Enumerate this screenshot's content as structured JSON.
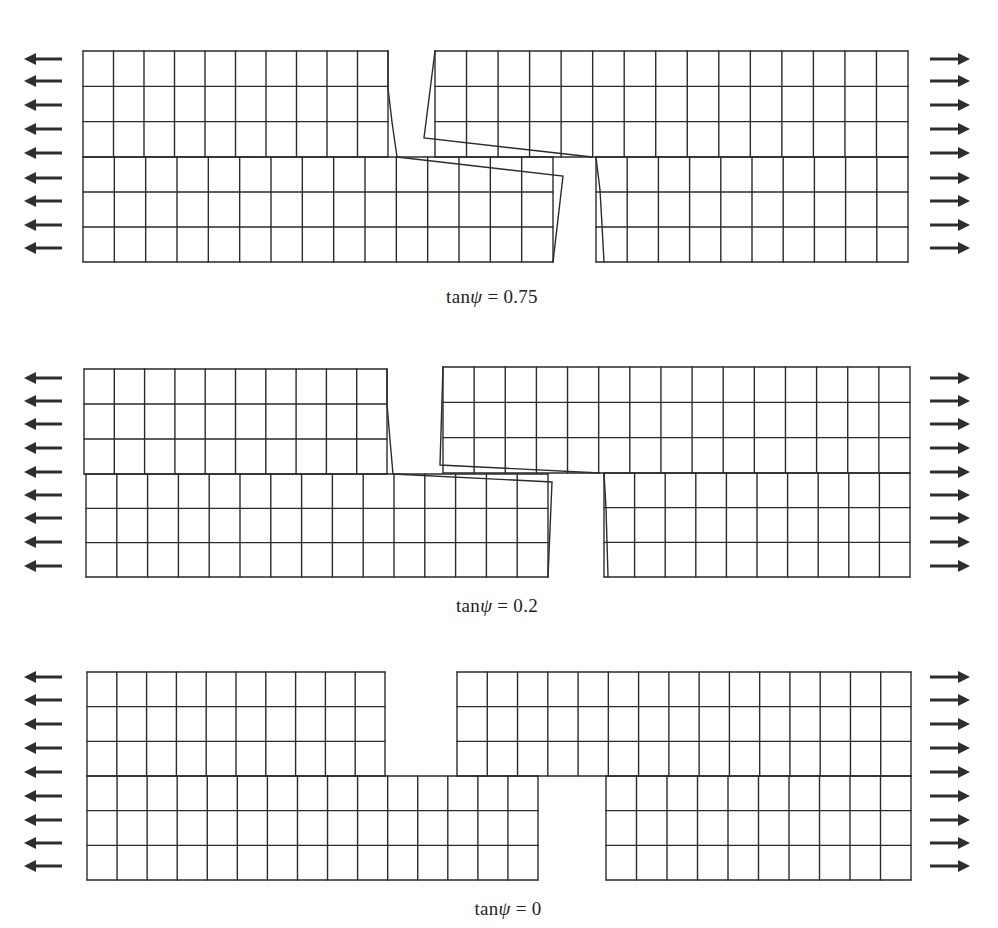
{
  "figure": {
    "background": "#ffffff",
    "line_color": "#2b2b2b",
    "panels": [
      {
        "id": "panel-1",
        "caption": {
          "prefix": "tan",
          "symbol": "ψ",
          "suffix": " = 0.75",
          "x": 492,
          "y": 288
        },
        "rows": {
          "top": 51,
          "mid": 157,
          "bottom": 262,
          "n_upper": 3,
          "n_lower": 3
        },
        "blocks": [
          {
            "name": "upper-left-block",
            "x0": 83,
            "x1": 388,
            "y0": 51,
            "y1": 157,
            "cols": 10,
            "skew_right": [
              [
                388,
                51
              ],
              [
                388,
                88
              ],
              [
                392,
                122
              ],
              [
                397,
                157
              ]
            ]
          },
          {
            "name": "lower-left-block",
            "x0": 83,
            "x1": 553,
            "y0": 157,
            "y1": 262,
            "cols": 15,
            "tip": [
              [
                397,
                157
              ],
              [
                563,
                176
              ],
              [
                553,
                262
              ]
            ]
          },
          {
            "name": "upper-right-block",
            "x0": 435,
            "x1": 908,
            "y0": 51,
            "y1": 157,
            "cols": 15,
            "tip": [
              [
                435,
                51
              ],
              [
                424,
                138
              ],
              [
                592,
                157
              ]
            ]
          },
          {
            "name": "lower-right-block",
            "x0": 596,
            "x1": 908,
            "y0": 157,
            "y1": 262,
            "cols": 10,
            "skew_left": [
              [
                596,
                157
              ],
              [
                600,
                190
              ],
              [
                602,
                225
              ],
              [
                604,
                262
              ]
            ]
          }
        ],
        "arrows_y": [
          59,
          81,
          105,
          129,
          153,
          178,
          201,
          225,
          248
        ]
      },
      {
        "id": "panel-2",
        "caption": {
          "prefix": "tan",
          "symbol": "ψ",
          "suffix": " = 0.2",
          "x": 497,
          "y": 597
        },
        "rows": {
          "top": 369,
          "mid": 474,
          "bottom": 577,
          "n_upper": 3,
          "n_lower": 3
        },
        "blocks": [
          {
            "name": "upper-left-block",
            "x0": 84,
            "x1": 387,
            "y0": 369,
            "y1": 474,
            "cols": 10,
            "skew_right": [
              [
                387,
                369
              ],
              [
                387,
                404
              ],
              [
                390,
                440
              ],
              [
                393,
                474
              ]
            ]
          },
          {
            "name": "lower-left-block",
            "x0": 86,
            "x1": 548,
            "y0": 474,
            "y1": 577,
            "cols": 15,
            "tip": [
              [
                393,
                474
              ],
              [
                552,
                482
              ],
              [
                548,
                577
              ]
            ]
          },
          {
            "name": "upper-right-block",
            "x0": 443,
            "x1": 910,
            "y0": 367,
            "y1": 473,
            "cols": 15,
            "tip": [
              [
                443,
                367
              ],
              [
                440,
                465
              ],
              [
                600,
                473
              ]
            ]
          },
          {
            "name": "lower-right-block",
            "x0": 604,
            "x1": 910,
            "y0": 473,
            "y1": 577,
            "cols": 10,
            "skew_left": [
              [
                604,
                473
              ],
              [
                606,
                508
              ],
              [
                607,
                542
              ],
              [
                608,
                577
              ]
            ]
          }
        ],
        "arrows_y": [
          378,
          401,
          424,
          448,
          472,
          495,
          518,
          542,
          566
        ]
      },
      {
        "id": "panel-3",
        "caption": {
          "prefix": "tan",
          "symbol": "ψ",
          "suffix": " = 0",
          "x": 508,
          "y": 900
        },
        "rows": {
          "top": 672,
          "mid": 776,
          "bottom": 880,
          "n_upper": 3,
          "n_lower": 3
        },
        "blocks": [
          {
            "name": "upper-left-block",
            "x0": 87,
            "x1": 385,
            "y0": 672,
            "y1": 776,
            "cols": 10
          },
          {
            "name": "lower-left-block",
            "x0": 87,
            "x1": 538,
            "y0": 776,
            "y1": 880,
            "cols": 15
          },
          {
            "name": "upper-right-block",
            "x0": 457,
            "x1": 911,
            "y0": 672,
            "y1": 776,
            "cols": 15
          },
          {
            "name": "lower-right-block",
            "x0": 606,
            "x1": 911,
            "y0": 776,
            "y1": 880,
            "cols": 10
          }
        ],
        "arrows_y": [
          677,
          700,
          724,
          748,
          772,
          796,
          820,
          843,
          866
        ]
      }
    ],
    "arrows": {
      "left": {
        "direction": "left",
        "tip_x": 24,
        "tail_x": 62
      },
      "right": {
        "direction": "right",
        "tail_x": 930,
        "tip_x": 970
      }
    }
  }
}
